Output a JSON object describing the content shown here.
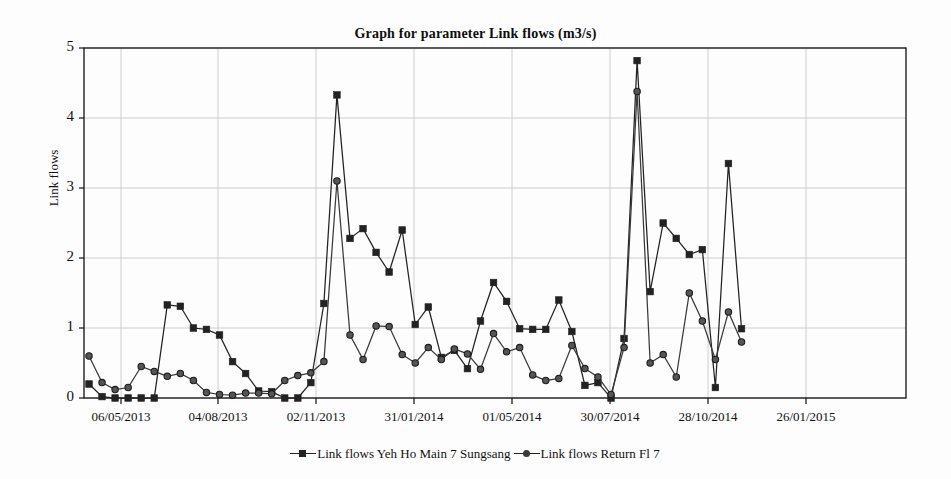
{
  "chart_data": {
    "type": "line",
    "title": "Graph for parameter Link flows (m3/s)",
    "xlabel": "",
    "ylabel": "Link flows",
    "ylim": [
      0,
      5
    ],
    "yticks": [
      0,
      1,
      2,
      3,
      4,
      5
    ],
    "grid": true,
    "legend_position": "bottom",
    "xtick_labels": [
      "06/05/2013",
      "04/08/2013",
      "02/11/2013",
      "31/01/2014",
      "01/05/2014",
      "30/07/2014",
      "28/10/2014",
      "26/01/2015"
    ],
    "x_index": [
      0,
      1,
      2,
      3,
      4,
      5,
      6,
      7,
      8,
      9,
      10,
      11,
      12,
      13,
      14,
      15,
      16,
      17,
      18,
      19,
      20,
      21,
      22,
      23,
      24,
      25,
      26,
      27,
      28,
      29,
      30,
      31,
      32,
      33,
      34,
      35,
      36,
      37,
      38,
      39,
      40,
      41,
      42,
      43,
      44,
      45,
      46,
      47,
      48,
      49,
      50,
      51,
      52,
      53,
      54,
      55,
      56,
      57,
      58,
      59,
      60,
      61,
      62,
      63
    ],
    "series": [
      {
        "name": "Link flows Yeh Ho Main 7 Sungsang",
        "marker": "square",
        "color": "#222222",
        "values": [
          0.2,
          0.02,
          0.0,
          0.0,
          0.0,
          0.0,
          1.33,
          1.31,
          1.0,
          0.98,
          0.9,
          0.52,
          0.35,
          0.1,
          0.09,
          0.0,
          0.0,
          0.22,
          1.35,
          4.33,
          2.28,
          2.42,
          2.08,
          1.8,
          2.4,
          1.05,
          1.3,
          0.58,
          0.68,
          0.42,
          1.1,
          1.65,
          1.38,
          0.99,
          0.98,
          0.98,
          1.4,
          0.95,
          0.18,
          0.22,
          0.0,
          0.85,
          4.82,
          1.52,
          2.5,
          2.28,
          2.05,
          2.12,
          0.15,
          3.35,
          0.99,
          0.0,
          0.0,
          0.0,
          0.0,
          0.0,
          0.0,
          0.0,
          0.0,
          0.0,
          0.0,
          0.0,
          0.0,
          0.0
        ]
      },
      {
        "name": "Link flows Return Fl 7",
        "marker": "circle",
        "color": "#3a3a3a",
        "values": [
          0.6,
          0.22,
          0.12,
          0.15,
          0.45,
          0.38,
          0.31,
          0.35,
          0.25,
          0.08,
          0.05,
          0.04,
          0.07,
          0.07,
          0.06,
          0.25,
          0.32,
          0.36,
          0.52,
          3.1,
          0.9,
          0.55,
          1.03,
          1.02,
          0.62,
          0.5,
          0.72,
          0.55,
          0.7,
          0.63,
          0.41,
          0.92,
          0.66,
          0.72,
          0.33,
          0.25,
          0.28,
          0.75,
          0.42,
          0.3,
          0.05,
          0.72,
          4.38,
          0.5,
          0.62,
          0.3,
          1.5,
          1.1,
          0.55,
          1.23,
          0.8,
          0.0,
          0.0,
          0.0,
          0.0,
          0.0,
          0.0,
          0.0,
          0.0,
          0.0,
          0.0,
          0.0,
          0.0,
          0.0
        ]
      }
    ],
    "n_points": 51
  },
  "legend": {
    "entries": [
      {
        "label": "Link flows Yeh Ho Main 7 Sungsang",
        "marker": "square-marker-icon"
      },
      {
        "label": "Link flows Return Fl 7",
        "marker": "circle-marker-icon"
      }
    ]
  },
  "axis": {
    "y_label": "Link flows",
    "y_ticks": [
      "0",
      "1",
      "2",
      "3",
      "4",
      "5"
    ],
    "x_ticks": [
      "06/05/2013",
      "04/08/2013",
      "02/11/2013",
      "31/01/2014",
      "01/05/2014",
      "30/07/2014",
      "28/10/2014",
      "26/01/2015"
    ]
  },
  "title": "Graph for parameter Link flows (m3/s)",
  "colors": {
    "series1": "#222222",
    "series2": "#3a3a3a",
    "grid": "#c8c8c8",
    "axis": "#111111",
    "background": "#fdfdfd"
  }
}
